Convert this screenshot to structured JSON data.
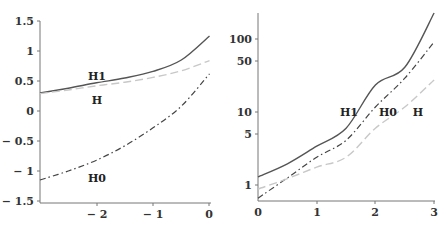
{
  "chart_data": [
    {
      "type": "line",
      "title": "",
      "xlabel": "",
      "ylabel": "",
      "xlim": [
        -3,
        0
      ],
      "ylim": [
        -1.5,
        1.5
      ],
      "yscale": "linear",
      "grid": false,
      "legend": "inline labels",
      "x_ticks": [
        -2,
        -1,
        0
      ],
      "x_tick_labels": [
        "− 2",
        "− 1",
        "0"
      ],
      "y_ticks": [
        1.5,
        1,
        0.5,
        0,
        -0.5,
        -1,
        -1.5
      ],
      "y_tick_labels": [
        "1.5",
        "1",
        "0.5",
        "0",
        "− 0.5",
        "− 1",
        "− 1.5"
      ],
      "x": [
        -3,
        -2.5,
        -2,
        -1.5,
        -1,
        -0.5,
        0
      ],
      "series": [
        {
          "name": "H1",
          "style": "solid",
          "color": "#555555",
          "values": [
            0.3,
            0.38,
            0.47,
            0.55,
            0.66,
            0.85,
            1.25
          ]
        },
        {
          "name": "H",
          "style": "dashed",
          "color": "#c8c8c8",
          "values": [
            0.29,
            0.35,
            0.42,
            0.48,
            0.56,
            0.67,
            0.84
          ]
        },
        {
          "name": "H0",
          "style": "dashdot",
          "color": "#444444",
          "values": [
            -1.15,
            -1.0,
            -0.82,
            -0.58,
            -0.28,
            0.08,
            0.62
          ]
        }
      ],
      "annotations": [
        {
          "text": "H1",
          "x": -2.0,
          "y": 0.57
        },
        {
          "text": "H",
          "x": -2.0,
          "y": 0.17
        },
        {
          "text": "H0",
          "x": -2.0,
          "y": -1.13
        }
      ]
    },
    {
      "type": "line",
      "title": "",
      "xlabel": "",
      "ylabel": "",
      "xlim": [
        0,
        3
      ],
      "ylim": [
        0.55,
        227
      ],
      "yscale": "log",
      "grid": false,
      "legend": "inline labels",
      "x_ticks": [
        0,
        1,
        2,
        3
      ],
      "x_tick_labels": [
        "0",
        "1",
        "2",
        "3"
      ],
      "y_ticks": [
        100,
        50,
        10,
        5,
        1
      ],
      "y_tick_labels": [
        "100",
        "50",
        "10",
        "5",
        "1"
      ],
      "x": [
        0,
        0.5,
        1,
        1.5,
        2,
        2.5,
        3
      ],
      "series": [
        {
          "name": "H1",
          "style": "solid",
          "color": "#555555",
          "values": [
            1.29,
            1.95,
            3.4,
            6.0,
            23.4,
            41,
            227
          ]
        },
        {
          "name": "H0",
          "style": "dashdot",
          "color": "#444444",
          "values": [
            0.66,
            1.25,
            2.4,
            4.1,
            11.7,
            29,
            91
          ]
        },
        {
          "name": "H",
          "style": "dashed",
          "color": "#c8c8c8",
          "values": [
            0.88,
            1.22,
            1.76,
            2.4,
            6.0,
            11.7,
            27.5
          ]
        }
      ],
      "annotations": [
        {
          "text": "H1",
          "x": 1.55,
          "y": 10
        },
        {
          "text": "H0",
          "x": 2.2,
          "y": 10
        },
        {
          "text": "H",
          "x": 2.7,
          "y": 10
        }
      ]
    }
  ],
  "labels": {
    "left": {
      "H1": "H1",
      "H": "H",
      "H0": "H0"
    },
    "right": {
      "H1": "H1",
      "H0": "H0",
      "H": "H"
    }
  },
  "ticks": {
    "left_y": [
      "1.5",
      "1",
      "0.5",
      "0",
      "− 0.5",
      "− 1",
      "− 1.5"
    ],
    "left_x": [
      "− 2",
      "− 1",
      "0"
    ],
    "right_y": [
      "100",
      "50",
      "10",
      "5",
      "1"
    ],
    "right_x": [
      "0",
      "1",
      "2",
      "3"
    ]
  }
}
